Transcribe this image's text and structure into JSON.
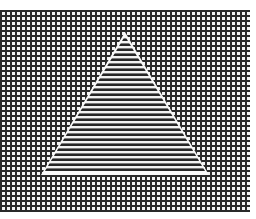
{
  "figure": {
    "description": "Triangle of horizontal stripes on a square grid background (illusory contour stimulus)",
    "background_pattern": "square-grid",
    "shape": "triangle",
    "shape_pattern": "horizontal-stripes",
    "colors": {
      "ink": "#2a2a2a",
      "paper": "#f4f4f4",
      "halo": "#fafafa"
    }
  }
}
